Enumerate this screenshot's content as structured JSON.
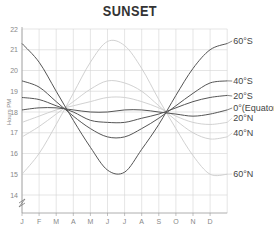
{
  "chart_data": {
    "type": "line",
    "title": "SUNSET",
    "xlabel": "",
    "ylabel": "Hours PM",
    "ylim": [
      13,
      22
    ],
    "y_ticks": [
      14,
      15,
      16,
      17,
      18,
      19,
      20,
      21,
      22
    ],
    "axis_break": true,
    "grid": true,
    "legend_position": "inline-right",
    "categories": [
      "J",
      "F",
      "M",
      "A",
      "M",
      "J",
      "J",
      "A",
      "S",
      "O",
      "N",
      "D",
      "end"
    ],
    "series": [
      {
        "name": "60°S",
        "style": "dark",
        "values": [
          21.3,
          20.4,
          19.0,
          17.6,
          16.3,
          15.2,
          15.1,
          16.2,
          17.4,
          18.8,
          20.1,
          21.0,
          21.3
        ]
      },
      {
        "name": "40°S",
        "style": "dark",
        "values": [
          19.5,
          19.2,
          18.5,
          17.8,
          17.2,
          16.8,
          16.8,
          17.2,
          17.7,
          18.3,
          18.9,
          19.4,
          19.5
        ]
      },
      {
        "name": "20°S",
        "style": "dark",
        "values": [
          18.7,
          18.6,
          18.3,
          18.0,
          17.6,
          17.5,
          17.5,
          17.7,
          17.9,
          18.2,
          18.5,
          18.7,
          18.8
        ]
      },
      {
        "name": "0°(Equator)",
        "style": "dark",
        "values": [
          18.1,
          18.2,
          18.2,
          18.1,
          18.0,
          18.0,
          18.1,
          18.1,
          18.0,
          17.9,
          17.8,
          17.9,
          18.1
        ]
      },
      {
        "name": "20°N",
        "style": "light",
        "values": [
          17.5,
          17.8,
          18.1,
          18.3,
          18.5,
          18.7,
          18.7,
          18.5,
          18.2,
          17.8,
          17.5,
          17.4,
          17.5
        ]
      },
      {
        "name": "40°N",
        "style": "light",
        "values": [
          16.8,
          17.3,
          17.9,
          18.5,
          19.1,
          19.5,
          19.4,
          19.0,
          18.3,
          17.6,
          17.0,
          16.7,
          16.8
        ]
      },
      {
        "name": "60°N",
        "style": "light",
        "values": [
          15.0,
          16.0,
          17.4,
          18.9,
          20.4,
          21.4,
          21.2,
          20.1,
          18.6,
          17.2,
          15.9,
          15.0,
          15.0
        ]
      }
    ],
    "annotations": [
      "60°S",
      "40°S",
      "20°S",
      "0°(Equator)",
      "20°N",
      "40°N",
      "60°N"
    ]
  },
  "title": "SUNSET",
  "y_axis_label": "Hours PM",
  "x_ticks": [
    "J",
    "F",
    "M",
    "A",
    "M",
    "J",
    "J",
    "A",
    "S",
    "O",
    "N",
    "D"
  ],
  "y_ticks": [
    "22",
    "21",
    "20",
    "19",
    "18",
    "17",
    "16",
    "15",
    "14"
  ],
  "series_labels": [
    "60°S",
    "40°S",
    "20°S",
    "0°(Equator)",
    "20°N",
    "40°N",
    "60°N"
  ],
  "colors": {
    "dark": "#555555",
    "light": "#cccccc",
    "grid": "#d4d4d4",
    "axis": "#999999"
  }
}
